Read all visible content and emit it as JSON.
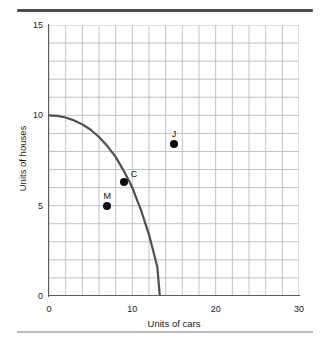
{
  "figure": {
    "rule_top_color": "#4b4f54",
    "rule_bottom_color": "#b9bcc0",
    "background": "#ffffff"
  },
  "chart_data": {
    "type": "line",
    "title": "",
    "subtitle": "",
    "xlabel": "Units of cars",
    "ylabel": "Units of houses",
    "xlim": [
      0,
      30
    ],
    "ylim": [
      0,
      15
    ],
    "xticks": [
      0,
      10,
      20,
      30
    ],
    "xtick_labels": [
      "0",
      "10",
      "20",
      "30"
    ],
    "yticks": [
      0,
      5,
      10,
      15
    ],
    "ytick_labels": [
      "0",
      "5",
      "10",
      "15"
    ],
    "grid": true,
    "grid_color": "#b9bcbe",
    "grid_x_step": 2,
    "grid_y_step": 1,
    "legend": "none",
    "series": [
      {
        "name": "Production possibilities frontier",
        "type": "curve",
        "color": "#4d4f52",
        "linewidth": 2.2,
        "x": [
          0,
          1,
          2,
          3,
          4,
          5,
          6,
          7,
          8,
          9,
          10,
          11,
          12,
          13,
          13.3
        ],
        "y": [
          10.0,
          9.97,
          9.88,
          9.72,
          9.5,
          9.2,
          8.8,
          8.3,
          7.7,
          6.9,
          6.0,
          4.8,
          3.4,
          1.6,
          0.0
        ]
      }
    ],
    "points": [
      {
        "label": "M",
        "x": 7.0,
        "y": 5.0,
        "color": "#0b0b0b",
        "label_position": "above"
      },
      {
        "label": "C",
        "x": 9.0,
        "y": 6.3,
        "color": "#0b0b0b",
        "label_position": "upper-right"
      },
      {
        "label": "J",
        "x": 15.0,
        "y": 8.4,
        "color": "#0b0b0b",
        "label_position": "above"
      }
    ],
    "annotations": []
  }
}
